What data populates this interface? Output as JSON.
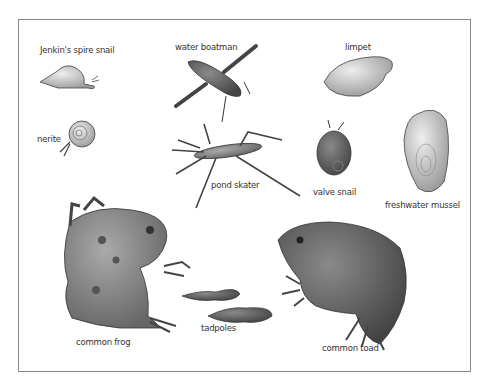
{
  "labels": {
    "jenkins_spire_snail": "Jenkin's spire snail",
    "water_boatman": "water boatman",
    "limpet": "limpet",
    "nerite": "nerite",
    "pond_skater": "pond skater",
    "valve_snail": "valve snail",
    "freshwater_mussel": "freshwater mussel",
    "tadpoles": "tadpoles",
    "common_frog": "common frog",
    "common_toad": "common toad"
  },
  "colors": {
    "frame": "#888888",
    "ink": "#333333",
    "shell_light": "#cfcfcf",
    "body_mid": "#8a8a8a",
    "body_dark": "#555555"
  }
}
